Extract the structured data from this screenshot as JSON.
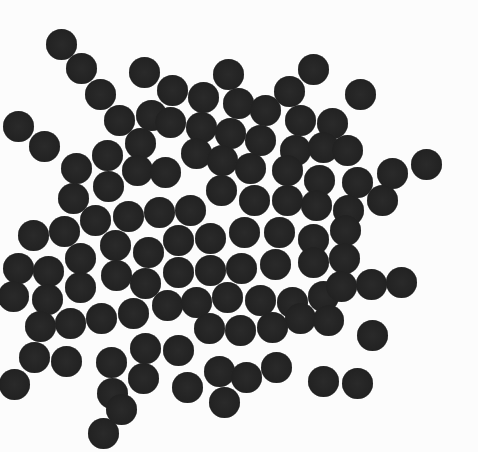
{
  "scene": {
    "description": "Photograph of many dark round discs scattered in a dense cluster on a white background",
    "background_color": "#fcfcfc",
    "disc_color": "#232323",
    "disc_diameter": 31,
    "discs": [
      [
        61,
        44
      ],
      [
        81,
        68
      ],
      [
        100,
        94
      ],
      [
        144,
        72
      ],
      [
        228,
        74
      ],
      [
        313,
        69
      ],
      [
        360,
        94
      ],
      [
        18,
        126
      ],
      [
        44,
        146
      ],
      [
        119,
        120
      ],
      [
        151,
        115
      ],
      [
        172,
        90
      ],
      [
        203,
        97
      ],
      [
        238,
        103
      ],
      [
        265,
        110
      ],
      [
        289,
        91
      ],
      [
        300,
        120
      ],
      [
        332,
        123
      ],
      [
        76,
        168
      ],
      [
        107,
        155
      ],
      [
        140,
        143
      ],
      [
        170,
        122
      ],
      [
        201,
        127
      ],
      [
        230,
        133
      ],
      [
        260,
        140
      ],
      [
        295,
        150
      ],
      [
        323,
        147
      ],
      [
        347,
        150
      ],
      [
        73,
        198
      ],
      [
        108,
        186
      ],
      [
        137,
        170
      ],
      [
        165,
        172
      ],
      [
        196,
        153
      ],
      [
        222,
        160
      ],
      [
        250,
        168
      ],
      [
        287,
        170
      ],
      [
        319,
        180
      ],
      [
        357,
        182
      ],
      [
        392,
        173
      ],
      [
        426,
        164
      ],
      [
        33,
        235
      ],
      [
        64,
        231
      ],
      [
        95,
        220
      ],
      [
        128,
        216
      ],
      [
        159,
        212
      ],
      [
        190,
        210
      ],
      [
        221,
        190
      ],
      [
        254,
        200
      ],
      [
        287,
        200
      ],
      [
        316,
        205
      ],
      [
        348,
        210
      ],
      [
        382,
        200
      ],
      [
        18,
        268
      ],
      [
        48,
        271
      ],
      [
        80,
        258
      ],
      [
        115,
        245
      ],
      [
        148,
        252
      ],
      [
        178,
        240
      ],
      [
        210,
        238
      ],
      [
        244,
        232
      ],
      [
        279,
        232
      ],
      [
        313,
        239
      ],
      [
        345,
        230
      ],
      [
        13,
        296
      ],
      [
        47,
        299
      ],
      [
        80,
        287
      ],
      [
        116,
        275
      ],
      [
        145,
        283
      ],
      [
        178,
        272
      ],
      [
        210,
        270
      ],
      [
        241,
        268
      ],
      [
        275,
        264
      ],
      [
        313,
        262
      ],
      [
        344,
        258
      ],
      [
        371,
        284
      ],
      [
        401,
        282
      ],
      [
        40,
        326
      ],
      [
        70,
        323
      ],
      [
        101,
        318
      ],
      [
        133,
        313
      ],
      [
        167,
        305
      ],
      [
        196,
        302
      ],
      [
        227,
        297
      ],
      [
        260,
        300
      ],
      [
        292,
        302
      ],
      [
        323,
        296
      ],
      [
        341,
        286
      ],
      [
        34,
        357
      ],
      [
        66,
        361
      ],
      [
        111,
        362
      ],
      [
        145,
        348
      ],
      [
        178,
        350
      ],
      [
        209,
        328
      ],
      [
        240,
        330
      ],
      [
        272,
        327
      ],
      [
        300,
        318
      ],
      [
        328,
        320
      ],
      [
        372,
        335
      ],
      [
        14,
        384
      ],
      [
        112,
        393
      ],
      [
        143,
        378
      ],
      [
        187,
        387
      ],
      [
        219,
        371
      ],
      [
        246,
        377
      ],
      [
        276,
        367
      ],
      [
        323,
        381
      ],
      [
        357,
        383
      ],
      [
        121,
        409
      ],
      [
        103,
        433
      ],
      [
        224,
        402
      ]
    ]
  }
}
